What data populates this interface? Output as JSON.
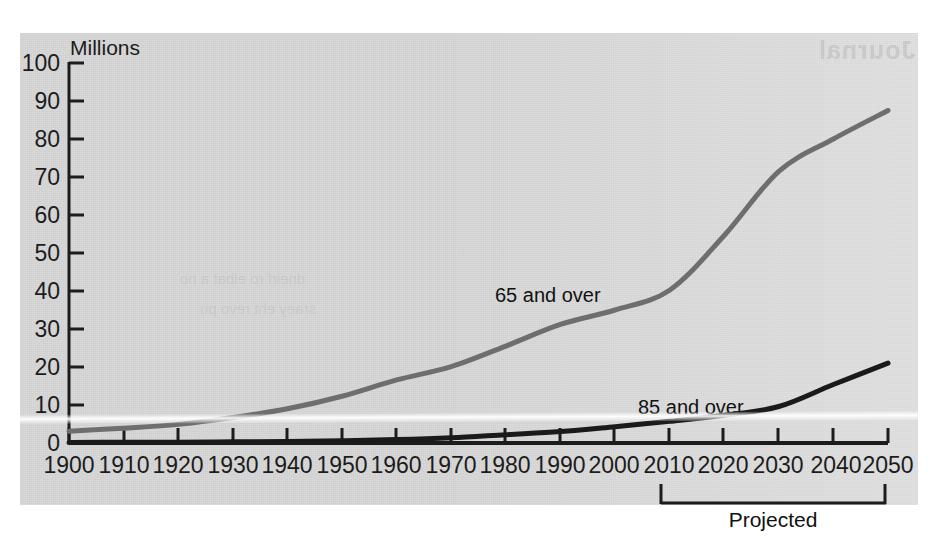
{
  "chart_data": {
    "type": "line",
    "title": "",
    "ylabel": "Millions",
    "xlabel": "",
    "ylim": [
      0,
      100
    ],
    "yticks": [
      0,
      10,
      20,
      30,
      40,
      50,
      60,
      70,
      80,
      90,
      100
    ],
    "xlim": [
      1900,
      2050
    ],
    "x": [
      1900,
      1910,
      1920,
      1930,
      1940,
      1950,
      1960,
      1970,
      1980,
      1990,
      2000,
      2010,
      2020,
      2030,
      2040,
      2050
    ],
    "xticks": [
      "1900",
      "1910",
      "1920",
      "1930",
      "1940",
      "1950",
      "1960",
      "1970",
      "1980",
      "1990",
      "2000",
      "2010",
      "2020",
      "2030",
      "2040",
      "2050"
    ],
    "grid": false,
    "legend_position": "inline-annotation",
    "series": [
      {
        "name": "65 and over",
        "color": "#6e6e6e",
        "values": [
          3.1,
          3.9,
          4.9,
          6.7,
          9.0,
          12.3,
          16.6,
          20.1,
          25.5,
          31.2,
          35.0,
          40.2,
          54.6,
          71.5,
          80.0,
          87.5
        ]
      },
      {
        "name": "85 and over",
        "color": "#1a1a1a",
        "values": [
          0.1,
          0.2,
          0.2,
          0.3,
          0.4,
          0.6,
          0.9,
          1.4,
          2.2,
          3.0,
          4.3,
          5.7,
          7.3,
          9.6,
          15.4,
          21.0
        ]
      }
    ],
    "annotations": [
      {
        "text": "65 and over",
        "x": 1977,
        "y": 42
      },
      {
        "text": "85 and over",
        "x": 2013,
        "y": 14
      },
      {
        "text": "Projected",
        "span": [
          2010,
          2050
        ]
      }
    ]
  },
  "axes": {
    "unit": "Millions",
    "y_ticks": [
      "100",
      "90",
      "80",
      "70",
      "60",
      "50",
      "40",
      "30",
      "20",
      "10",
      "0"
    ],
    "x_ticks": [
      "1900",
      "1910",
      "1920",
      "1930",
      "1940",
      "1950",
      "1960",
      "1970",
      "1980",
      "1990",
      "2000",
      "2010",
      "2020",
      "2030",
      "2040",
      "2050"
    ]
  },
  "labels": {
    "series_65": "65 and over",
    "series_85": "85 and over",
    "projected": "Projected"
  },
  "ghost": {
    "heading": "Journal",
    "line1": "dneirf ro elbat a no",
    "line2": "sraey eht revo pu"
  },
  "colors": {
    "paper": "#d7d7d7",
    "ink": "#1c1c1c",
    "series_65": "#6e6e6e",
    "series_85": "#1a1a1a"
  }
}
